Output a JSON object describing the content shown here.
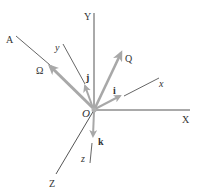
{
  "diagram": {
    "colors": {
      "axis": "#555555",
      "vector": "#a8a8a8",
      "text": "#333333",
      "origin_dot": "#b0b0b0"
    },
    "fixed_axes": {
      "X": {
        "label": "X"
      },
      "Y": {
        "label": "Y"
      },
      "Z": {
        "label": "Z"
      }
    },
    "rotating_axes": {
      "x": {
        "label": "x"
      },
      "y": {
        "label": "y"
      },
      "z": {
        "label": "z"
      }
    },
    "axis_A": {
      "label": "A"
    },
    "origin": {
      "label": "O"
    },
    "vectors": {
      "omega": {
        "label": "Ω"
      },
      "Q": {
        "label": "Q"
      },
      "i": {
        "label": "i"
      },
      "j": {
        "label": "j"
      },
      "k": {
        "label": "k"
      }
    }
  }
}
